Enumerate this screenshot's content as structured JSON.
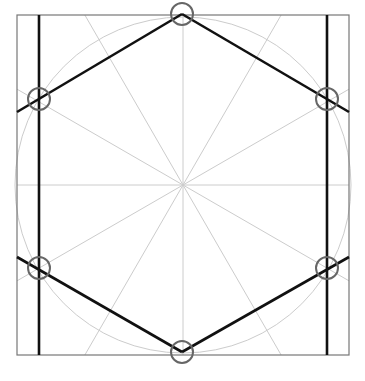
{
  "diagram": {
    "frame": {
      "x": 17,
      "y": 15,
      "width": 332,
      "height": 340,
      "stroke": "#777777"
    },
    "circle": {
      "cx": 183,
      "cy": 185,
      "r": 168,
      "stroke": "#cccccc"
    },
    "center": {
      "x": 183,
      "y": 185
    },
    "radial_lines": {
      "count": 12,
      "stroke": "#cccccc"
    },
    "hexagon": {
      "stroke": "#111111",
      "vertices": [
        {
          "x": 182,
          "y": 14
        },
        {
          "x": 327,
          "y": 99
        },
        {
          "x": 327,
          "y": 268
        },
        {
          "x": 182,
          "y": 352
        },
        {
          "x": 39,
          "y": 268
        },
        {
          "x": 39,
          "y": 99
        }
      ]
    },
    "vertical_lines": [
      {
        "x": 39,
        "y1": 15,
        "y2": 355
      },
      {
        "x": 327,
        "y1": 15,
        "y2": 355
      }
    ],
    "extended_edges": [
      {
        "x1": 17,
        "y1": 112,
        "x2": 182,
        "y2": 14
      },
      {
        "x1": 182,
        "y1": 14,
        "x2": 349,
        "y2": 112
      },
      {
        "x1": 17,
        "y1": 257,
        "x2": 182,
        "y2": 352
      },
      {
        "x1": 182,
        "y1": 352,
        "x2": 349,
        "y2": 257
      }
    ],
    "markers": {
      "r": 11,
      "stroke": "#666666",
      "points": [
        {
          "x": 182,
          "y": 14
        },
        {
          "x": 327,
          "y": 99
        },
        {
          "x": 327,
          "y": 268
        },
        {
          "x": 182,
          "y": 352
        },
        {
          "x": 39,
          "y": 268
        },
        {
          "x": 39,
          "y": 99
        }
      ]
    }
  }
}
